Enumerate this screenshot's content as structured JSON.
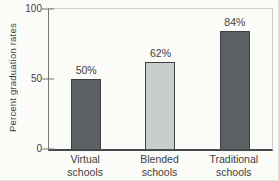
{
  "chart_data": {
    "type": "bar",
    "title": "",
    "xlabel": "",
    "ylabel": "Percent graduation rates",
    "ylim": [
      0,
      100
    ],
    "yticks": [
      0,
      50,
      100
    ],
    "grid": false,
    "legend": false,
    "categories": [
      "Virtual schools",
      "Blended schools",
      "Traditional schools"
    ],
    "values": [
      50,
      62,
      84
    ],
    "value_labels": [
      "50%",
      "62%",
      "84%"
    ],
    "bar_colors": [
      "#5b6064",
      "#cacecb",
      "#5b6064"
    ],
    "bar_border_color": "#3c4043"
  },
  "yaxis": {
    "label": "Percent graduation rates",
    "ticks": [
      {
        "label": "100",
        "value": 100
      },
      {
        "label": "50",
        "value": 50
      },
      {
        "label": "0",
        "value": 0
      }
    ]
  },
  "bars": [
    {
      "cat_line1": "Virtual",
      "cat_line2": "schools",
      "value": 50,
      "value_label": "50%",
      "color": "#5b6064"
    },
    {
      "cat_line1": "Blended",
      "cat_line2": "schools",
      "value": 62,
      "value_label": "62%",
      "color": "#cacecb"
    },
    {
      "cat_line1": "Traditional",
      "cat_line2": "schools",
      "value": 84,
      "value_label": "84%",
      "color": "#5b6064"
    }
  ],
  "colors": {
    "background": "#fbfbf8",
    "axis_dark": "#45494c",
    "axis_medium": "#74787b",
    "box_light": "#cbcbc7",
    "text": "#3e4144",
    "bar_dark": "#5b6064",
    "bar_light": "#cacecb"
  }
}
